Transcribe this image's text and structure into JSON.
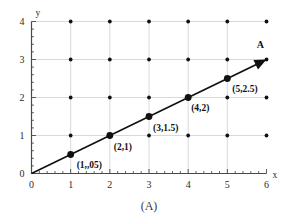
{
  "figure": {
    "caption": "(A)",
    "vector_label": "A",
    "axis_x_name": "x",
    "axis_y_name": "y"
  },
  "chart_data": {
    "type": "line",
    "title": "",
    "subtitle": "",
    "xlabel": "x",
    "ylabel": "y",
    "xlim": [
      0,
      6
    ],
    "ylim": [
      0,
      4
    ],
    "xticks": [
      "0",
      "1",
      "2",
      "3",
      "4",
      "5",
      "6"
    ],
    "yticks": [
      "0",
      "1",
      "2",
      "3",
      "4"
    ],
    "xtick_values": [
      0,
      1,
      2,
      3,
      4,
      5,
      6
    ],
    "ytick_values": [
      0,
      1,
      2,
      3,
      4
    ],
    "minor_ticks_per_interval": 4,
    "grid": true,
    "grid_color": "#c9c9c9",
    "lattice_dots": true,
    "lattice_dot_color": "#111111",
    "legend": "none",
    "series": [
      {
        "name": "A",
        "type": "line-with-markers",
        "color": "#111111",
        "arrow_end": true,
        "x": [
          0,
          1,
          2,
          3,
          4,
          5,
          6
        ],
        "y": [
          0,
          0.5,
          1,
          1.5,
          2,
          2.5,
          3
        ],
        "slope": 0.5,
        "intercept": 0,
        "markers": [
          {
            "x": 1,
            "y": 0.5,
            "label": "(1,,05)"
          },
          {
            "x": 2,
            "y": 1,
            "label": "(2,1)"
          },
          {
            "x": 3,
            "y": 1.5,
            "label": "(3,1.5)"
          },
          {
            "x": 4,
            "y": 2,
            "label": "(4,2)"
          },
          {
            "x": 5,
            "y": 2.5,
            "label": "(5,2.5)"
          }
        ]
      }
    ],
    "annotations": [
      {
        "text": "A",
        "x": 5.75,
        "y": 3.3
      },
      {
        "text": "(A)",
        "x": 3,
        "y": -0.95
      }
    ]
  }
}
